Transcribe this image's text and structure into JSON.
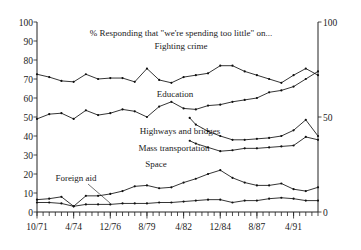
{
  "chart_data": {
    "type": "line",
    "title": "% Responding that \"we're spending too little\" on...",
    "xlabel": "",
    "ylabel": "",
    "ylim": [
      0,
      100
    ],
    "grid": false,
    "legend_position": "inline-labels",
    "left_axis_ticks": [
      "0",
      "10",
      "20",
      "30",
      "40",
      "50",
      "60",
      "70",
      "80",
      "90",
      "100"
    ],
    "right_axis_ticks": [
      "0",
      "50",
      "100"
    ],
    "x_tick_labels": [
      "10/71",
      "4/74",
      "12/76",
      "8/79",
      "4/82",
      "12/84",
      "8/87",
      "4/91"
    ],
    "x_tick_label_positions": [
      0,
      3,
      6,
      9,
      12,
      15,
      18,
      21
    ],
    "x_index_range": [
      0,
      23
    ],
    "annotations": [
      {
        "text": "Fighting crime",
        "x_px": 181,
        "y_px": 46
      },
      {
        "text": "Education",
        "x_px": 175,
        "y_px": 94
      },
      {
        "text": "Highways and bridges",
        "x_px": 180,
        "y_px": 131
      },
      {
        "text": "Mass transportation",
        "x_px": 174,
        "y_px": 148
      },
      {
        "text": "Space",
        "x_px": 156,
        "y_px": 164
      },
      {
        "text": "Foreign aid",
        "x_px": 76,
        "y_px": 178
      }
    ],
    "series": [
      {
        "name": "Fighting crime",
        "x": [
          0,
          1,
          2,
          3,
          4,
          5,
          6,
          7,
          8,
          9,
          10,
          11,
          12,
          13,
          14,
          15,
          16,
          17,
          18,
          19,
          20,
          21,
          22,
          23
        ],
        "values": [
          72.5,
          71,
          69,
          68.5,
          72.5,
          70,
          70.5,
          70.5,
          68.5,
          75.5,
          69.5,
          68,
          71,
          72,
          73,
          77,
          77,
          74,
          72,
          70,
          68,
          72,
          75.5,
          72
        ]
      },
      {
        "name": "Education",
        "x": [
          0,
          1,
          2,
          3,
          4,
          5,
          6,
          7,
          8,
          9,
          10,
          11,
          12,
          13,
          14,
          15,
          16,
          17,
          18,
          19,
          20,
          21,
          22,
          23
        ],
        "values": [
          49,
          51.5,
          52,
          49,
          53.5,
          51,
          52,
          54,
          53,
          50,
          55.5,
          58,
          54.5,
          54,
          56,
          56.5,
          58,
          59,
          60,
          63,
          64,
          66,
          70,
          74
        ]
      },
      {
        "name": "Highways and bridges",
        "x": [
          12.5,
          13,
          14,
          15,
          16,
          17,
          18,
          19,
          20,
          21,
          22,
          23
        ],
        "values": [
          49.5,
          46,
          42.5,
          40,
          38,
          38,
          38.5,
          39,
          40,
          43,
          48.5,
          40
        ]
      },
      {
        "name": "Mass transportation",
        "x": [
          12.5,
          13,
          14,
          15,
          16,
          17,
          18,
          19,
          20,
          21,
          22,
          23
        ],
        "values": [
          37.5,
          36,
          34,
          32,
          32.5,
          33.5,
          33.5,
          34,
          34.5,
          35,
          39.5,
          38
        ]
      },
      {
        "name": "Space",
        "x": [
          0,
          1,
          2,
          3,
          4,
          5,
          6,
          7,
          8,
          9,
          10,
          11,
          12,
          13,
          14,
          15,
          16,
          17,
          18,
          19,
          20,
          21,
          22,
          23
        ],
        "values": [
          6.5,
          7,
          8,
          3,
          8.5,
          8.5,
          9.5,
          11,
          13.5,
          14,
          12.5,
          13,
          15.5,
          17.5,
          20,
          22,
          18,
          15.5,
          14,
          14,
          15,
          12,
          11,
          13
        ]
      },
      {
        "name": "Foreign aid",
        "x": [
          0,
          1,
          2,
          3,
          4,
          5,
          6,
          7,
          8,
          9,
          10,
          11,
          12,
          13,
          14,
          15,
          16,
          17,
          18,
          19,
          20,
          21,
          22,
          23
        ],
        "values": [
          5,
          5,
          4.5,
          3,
          4,
          4,
          4,
          4.5,
          4.5,
          4.5,
          5,
          5,
          5.5,
          6,
          6.5,
          6.5,
          5,
          6,
          6,
          7,
          7.5,
          7,
          6,
          6
        ]
      }
    ]
  },
  "labels": {
    "title_line": "% Responding that \"we're spending too little\" on...",
    "s_crime": "Fighting crime",
    "s_education": "Education",
    "s_highways": "Highways and bridges",
    "s_transit": "Mass transportation",
    "s_space": "Space",
    "s_foreign": "Foreign aid",
    "y0": "0",
    "y10": "10",
    "y20": "20",
    "y30": "30",
    "y40": "40",
    "y50": "50",
    "y60": "60",
    "y70": "70",
    "y80": "80",
    "y90": "90",
    "y100": "100",
    "r0": "0",
    "r50": "50",
    "r100": "100",
    "x0": "10/71",
    "x1": "4/74",
    "x2": "12/76",
    "x3": "8/79",
    "x4": "4/82",
    "x5": "12/84",
    "x6": "8/87",
    "x7": "4/91"
  }
}
